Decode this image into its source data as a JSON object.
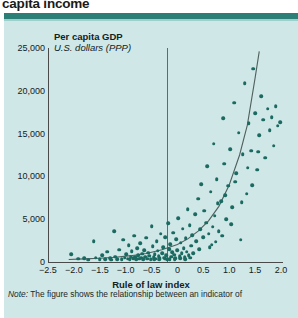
{
  "headline": "capita income",
  "panel": {
    "y_axis_title": "Per capita GDP",
    "y_axis_subtitle": "U.S. dollars (PPP)",
    "x_axis_label": "Rule of law index"
  },
  "note": {
    "prefix": "Note:",
    "text": " The figure shows the relationship between an indicator of"
  },
  "colors": {
    "panel_background": "#cfe7e6",
    "rule_bar": "#2b7f77",
    "marker": "#1b6a61",
    "axis": "#4a4a4a",
    "zero_line": "#5d6d6b",
    "text": "#12221f"
  },
  "chart_data": {
    "type": "scatter",
    "title": "Per capita GDP",
    "subtitle": "U.S. dollars (PPP)",
    "xlabel": "Rule of law index",
    "ylabel": "Per capita GDP, U.S. dollars (PPP)",
    "xlim": [
      -2.5,
      2.0
    ],
    "ylim": [
      0,
      25000
    ],
    "xticks": [
      -2.5,
      -2.0,
      -1.5,
      -1.0,
      -0.5,
      0,
      0.5,
      1.0,
      1.5,
      2.0
    ],
    "xticklabels": [
      "−2.5",
      "−2.0",
      "−1.5",
      "−1.0",
      "−0.5",
      "0",
      "0.5",
      "1.0",
      "1.5",
      "2.0"
    ],
    "yticks": [
      0,
      5000,
      10000,
      15000,
      20000,
      25000
    ],
    "yticklabels": [
      "0",
      "5,000",
      "10,000",
      "15,000",
      "20,000",
      "25,000"
    ],
    "grid": false,
    "legend": null,
    "reference_lines": [
      {
        "orientation": "vertical",
        "x": 0,
        "label": ""
      }
    ],
    "fit_curve": {
      "kind": "exponential",
      "points": [
        [
          -2.1,
          300
        ],
        [
          -1.8,
          360
        ],
        [
          -1.5,
          440
        ],
        [
          -1.2,
          560
        ],
        [
          -0.9,
          740
        ],
        [
          -0.6,
          1000
        ],
        [
          -0.3,
          1420
        ],
        [
          0.0,
          2050
        ],
        [
          0.2,
          2700
        ],
        [
          0.4,
          3600
        ],
        [
          0.6,
          4800
        ],
        [
          0.8,
          6500
        ],
        [
          1.0,
          9000
        ],
        [
          1.2,
          12500
        ],
        [
          1.35,
          16000
        ],
        [
          1.5,
          21500
        ],
        [
          1.58,
          24600
        ]
      ]
    },
    "points": [
      [
        -2.05,
        900
      ],
      [
        -1.92,
        380
      ],
      [
        -1.8,
        430
      ],
      [
        -1.72,
        290
      ],
      [
        -1.62,
        2450
      ],
      [
        -1.58,
        520
      ],
      [
        -1.5,
        330
      ],
      [
        -1.45,
        760
      ],
      [
        -1.4,
        300
      ],
      [
        -1.36,
        1180
      ],
      [
        -1.3,
        420
      ],
      [
        -1.28,
        260
      ],
      [
        -1.22,
        3600
      ],
      [
        -1.2,
        640
      ],
      [
        -1.16,
        350
      ],
      [
        -1.12,
        1450
      ],
      [
        -1.08,
        300
      ],
      [
        -1.05,
        2600
      ],
      [
        -1.02,
        520
      ],
      [
        -0.99,
        880
      ],
      [
        -0.96,
        380
      ],
      [
        -0.94,
        1950
      ],
      [
        -0.92,
        300
      ],
      [
        -0.9,
        640
      ],
      [
        -0.88,
        1250
      ],
      [
        -0.86,
        420
      ],
      [
        -0.84,
        3050
      ],
      [
        -0.82,
        560
      ],
      [
        -0.8,
        300
      ],
      [
        -0.78,
        1600
      ],
      [
        -0.76,
        760
      ],
      [
        -0.74,
        380
      ],
      [
        -0.72,
        2200
      ],
      [
        -0.7,
        500
      ],
      [
        -0.68,
        980
      ],
      [
        -0.66,
        320
      ],
      [
        -0.64,
        1400
      ],
      [
        -0.62,
        620
      ],
      [
        -0.6,
        2850
      ],
      [
        -0.58,
        400
      ],
      [
        -0.56,
        1100
      ],
      [
        -0.54,
        740
      ],
      [
        -0.52,
        340
      ],
      [
        -0.5,
        4150
      ],
      [
        -0.48,
        1850
      ],
      [
        -0.46,
        560
      ],
      [
        -0.44,
        900
      ],
      [
        -0.42,
        380
      ],
      [
        -0.4,
        2400
      ],
      [
        -0.38,
        1300
      ],
      [
        -0.36,
        660
      ],
      [
        -0.34,
        420
      ],
      [
        -0.32,
        3300
      ],
      [
        -0.3,
        1050
      ],
      [
        -0.28,
        1700
      ],
      [
        -0.26,
        520
      ],
      [
        -0.24,
        2900
      ],
      [
        -0.22,
        780
      ],
      [
        -0.2,
        360
      ],
      [
        -0.18,
        4500
      ],
      [
        -0.16,
        1500
      ],
      [
        -0.14,
        2050
      ],
      [
        -0.12,
        640
      ],
      [
        -0.1,
        1150
      ],
      [
        -0.08,
        3400
      ],
      [
        -0.06,
        860
      ],
      [
        -0.04,
        460
      ],
      [
        -0.02,
        2650
      ],
      [
        0.0,
        1350
      ],
      [
        0.02,
        5100
      ],
      [
        0.04,
        700
      ],
      [
        0.06,
        2250
      ],
      [
        0.08,
        1000
      ],
      [
        0.1,
        3900
      ],
      [
        0.12,
        1600
      ],
      [
        0.14,
        560
      ],
      [
        0.16,
        2800
      ],
      [
        0.18,
        1200
      ],
      [
        0.2,
        6200
      ],
      [
        0.22,
        800
      ],
      [
        0.24,
        4300
      ],
      [
        0.26,
        1900
      ],
      [
        0.28,
        3100
      ],
      [
        0.3,
        1050
      ],
      [
        0.34,
        5600
      ],
      [
        0.36,
        2400
      ],
      [
        0.4,
        7400
      ],
      [
        0.42,
        1500
      ],
      [
        0.44,
        3800
      ],
      [
        0.46,
        9100
      ],
      [
        0.5,
        2900
      ],
      [
        0.52,
        6000
      ],
      [
        0.56,
        4600
      ],
      [
        0.58,
        11200
      ],
      [
        0.6,
        3300
      ],
      [
        0.64,
        8200
      ],
      [
        0.66,
        2000
      ],
      [
        0.7,
        13800
      ],
      [
        0.72,
        5400
      ],
      [
        0.76,
        9700
      ],
      [
        0.8,
        3600
      ],
      [
        0.84,
        7100
      ],
      [
        0.88,
        16800
      ],
      [
        0.9,
        11500
      ],
      [
        0.94,
        5000
      ],
      [
        0.98,
        8900
      ],
      [
        1.02,
        13200
      ],
      [
        1.06,
        6400
      ],
      [
        1.1,
        18600
      ],
      [
        1.14,
        10400
      ],
      [
        1.18,
        15100
      ],
      [
        1.22,
        2600
      ],
      [
        1.26,
        12600
      ],
      [
        1.3,
        20900
      ],
      [
        1.34,
        8000
      ],
      [
        1.38,
        16200
      ],
      [
        1.42,
        13000
      ],
      [
        1.46,
        22600
      ],
      [
        1.5,
        17400
      ],
      [
        1.54,
        10800
      ],
      [
        1.58,
        14800
      ],
      [
        1.62,
        19400
      ],
      [
        1.66,
        16600
      ],
      [
        1.7,
        12200
      ],
      [
        1.74,
        17900
      ],
      [
        1.78,
        15400
      ],
      [
        1.82,
        16900
      ],
      [
        1.86,
        13600
      ],
      [
        1.9,
        18200
      ],
      [
        1.94,
        15900
      ],
      [
        1.98,
        16300
      ],
      [
        0.62,
        1700
      ],
      [
        0.68,
        4100
      ],
      [
        0.74,
        2350
      ],
      [
        0.78,
        6900
      ],
      [
        0.86,
        3050
      ],
      [
        0.92,
        7800
      ],
      [
        1.04,
        4400
      ],
      [
        1.12,
        9400
      ],
      [
        1.24,
        7000
      ],
      [
        1.36,
        11000
      ],
      [
        1.44,
        9000
      ],
      [
        1.56,
        12900
      ],
      [
        -0.05,
        350
      ],
      [
        0.05,
        420
      ],
      [
        0.15,
        300
      ],
      [
        0.25,
        480
      ],
      [
        -0.15,
        300
      ],
      [
        -0.25,
        380
      ],
      [
        -0.35,
        320
      ],
      [
        -0.45,
        300
      ]
    ]
  }
}
